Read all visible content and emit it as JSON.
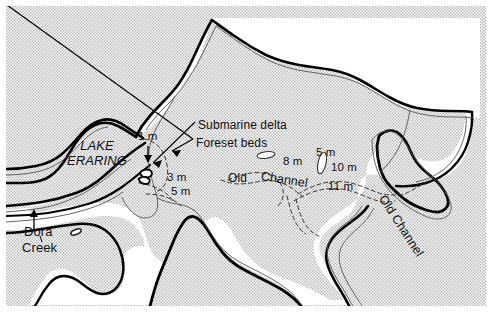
{
  "figure": {
    "kind": "bathymetric-map",
    "width": 492,
    "height": 318,
    "colors": {
      "land_shading": "#d0d0d0",
      "water": "#ffffff",
      "shoreline": "#000000",
      "contour": "#444444",
      "text": "#111111"
    }
  },
  "labels": {
    "lake_name_line1": "LAKE",
    "lake_name_line2": "ERARING",
    "submarine_delta": "Submarine delta",
    "foreset_beds": "Foreset beds",
    "old_channel_mid_word1": "Old",
    "old_channel_mid_word2": "Channel",
    "old_channel_right": "Old Channel",
    "dora": "Dora",
    "creek": "Creek"
  },
  "depths": [
    {
      "id": "depth-1m",
      "text": "1 m"
    },
    {
      "id": "depth-3m",
      "text": "3 m"
    },
    {
      "id": "depth-5m-west",
      "text": "5 m"
    },
    {
      "id": "depth-8m",
      "text": "8 m"
    },
    {
      "id": "depth-5m-east",
      "text": "5 m"
    },
    {
      "id": "depth-10m",
      "text": "10 m"
    },
    {
      "id": "depth-11m",
      "text": "11 m"
    }
  ]
}
